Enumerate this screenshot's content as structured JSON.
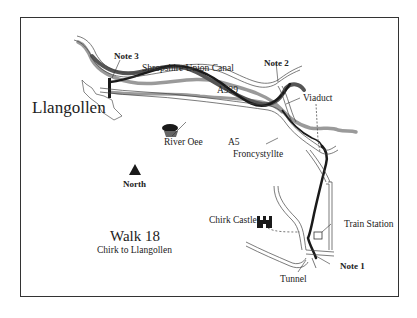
{
  "map": {
    "title": "Walk 18",
    "subtitle": "Chirk to Llangollen",
    "compass_label": "North",
    "colors": {
      "frame": "#333333",
      "route": "#1a1a1a",
      "canal": "#555555",
      "river": "#9a9a9a",
      "road_outline": "#444444",
      "background": "#ffffff"
    },
    "labels": {
      "town": "Llangollen",
      "canal": "Shropshire Union Canal",
      "road_a539": "A539",
      "road_a5": "A5",
      "river": "River Oee",
      "village": "Froncystyllte",
      "viaduct": "Viaduct",
      "castle": "Chirk Castle",
      "station": "Train Station",
      "tunnel": "Tunnel"
    },
    "notes": [
      {
        "id": "note1",
        "label": "Note 1"
      },
      {
        "id": "note2",
        "label": "Note 2"
      },
      {
        "id": "note3",
        "label": "Note 3"
      }
    ],
    "icons": {
      "compass": "north-triangle-icon",
      "castle": "castle-icon",
      "river_marker": "trees-icon",
      "station": "station-square-icon"
    }
  }
}
